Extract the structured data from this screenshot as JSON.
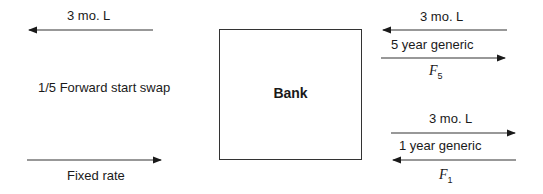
{
  "diagram": {
    "center": {
      "label": "Bank"
    },
    "left": {
      "top_flow": {
        "label": "3 mo. L",
        "direction": "left"
      },
      "title": "1/5 Forward start swap",
      "bottom_flow": {
        "label": "Fixed rate",
        "direction": "right"
      }
    },
    "right_upper": {
      "incoming": {
        "label": "3 mo. L",
        "direction": "left"
      },
      "swap_name": "5 year generic",
      "outgoing": {
        "label_main": "F",
        "label_sub": "5",
        "direction": "right"
      }
    },
    "right_lower": {
      "outgoing": {
        "label": "3 mo. L",
        "direction": "right"
      },
      "swap_name": "1 year generic",
      "incoming": {
        "label_main": "F",
        "label_sub": "1",
        "direction": "left"
      }
    }
  }
}
